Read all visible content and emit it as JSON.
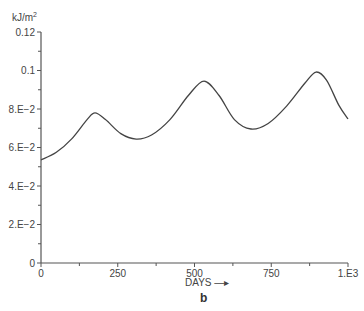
{
  "chart_data": {
    "type": "line",
    "title": "",
    "panel_label": "b",
    "xlabel": "DAYS",
    "xlabel_arrow": "→",
    "ylabel": "kJ/m²",
    "xlim": [
      0,
      1000
    ],
    "ylim": [
      0,
      0.12
    ],
    "grid": false,
    "legend": null,
    "x_ticks": [
      {
        "value": 0,
        "label": "0"
      },
      {
        "value": 250,
        "label": "250"
      },
      {
        "value": 500,
        "label": "500"
      },
      {
        "value": 750,
        "label": "750"
      },
      {
        "value": 1000,
        "label": "1.E3"
      }
    ],
    "x_minor_ticks": [
      125,
      375,
      625,
      875
    ],
    "y_ticks": [
      {
        "value": 0,
        "label": "0"
      },
      {
        "value": 0.02,
        "label": "2.E−2"
      },
      {
        "value": 0.04,
        "label": "4.E−2"
      },
      {
        "value": 0.06,
        "label": "6.E−2"
      },
      {
        "value": 0.08,
        "label": "8.E−2"
      },
      {
        "value": 0.1,
        "label": "0.1"
      },
      {
        "value": 0.12,
        "label": "0.12"
      }
    ],
    "y_minor_ticks": [
      0.01,
      0.03,
      0.05,
      0.07,
      0.09,
      0.11
    ],
    "series": [
      {
        "name": "energy",
        "color": "#444444",
        "x": [
          0,
          50,
          100,
          150,
          176,
          210,
          260,
          310,
          360,
          420,
          480,
          531,
          580,
          630,
          684,
          740,
          800,
          860,
          896,
          930,
          970,
          1000
        ],
        "y": [
          0.0535,
          0.0575,
          0.0645,
          0.0745,
          0.078,
          0.0745,
          0.0672,
          0.0644,
          0.0665,
          0.0745,
          0.087,
          0.0945,
          0.087,
          0.0745,
          0.0696,
          0.0725,
          0.0815,
          0.0935,
          0.0992,
          0.095,
          0.082,
          0.0748
        ]
      }
    ]
  }
}
